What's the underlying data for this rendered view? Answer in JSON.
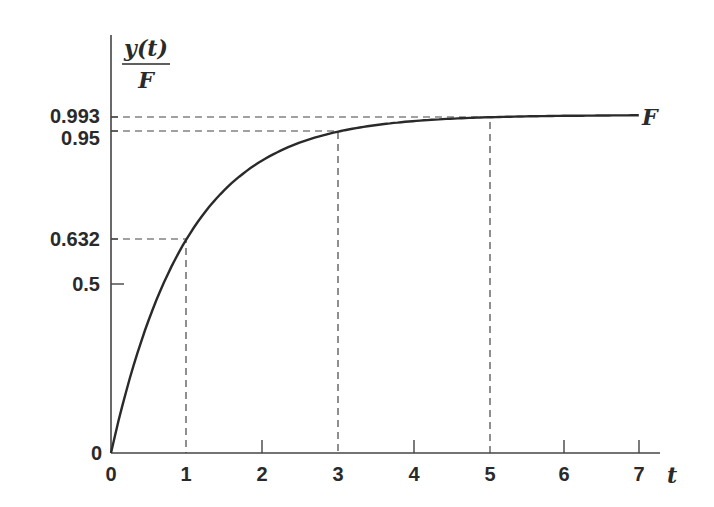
{
  "chart_data": {
    "type": "line",
    "title": "",
    "xlabel": "t",
    "ylabel": "y(t) / F",
    "ylabel_numerator": "y(t)",
    "ylabel_denominator": "F",
    "curve_label": "F",
    "function": "y(t)/F = 1 - exp(-t)",
    "xlim": [
      0,
      7
    ],
    "ylim": [
      0,
      1
    ],
    "grid": false,
    "x_ticks": [
      0,
      1,
      2,
      3,
      4,
      5,
      6,
      7
    ],
    "x_tick_labels": [
      "0",
      "1",
      "2",
      "3",
      "4",
      "5",
      "6",
      "7"
    ],
    "y_ticks": [
      0,
      0.5,
      0.632,
      0.95,
      0.993
    ],
    "y_tick_labels": [
      "0",
      "0.5",
      "0.632",
      "0.95",
      "0.993"
    ],
    "series": [
      {
        "name": "y(t)/F",
        "x": [
          0,
          0.5,
          1,
          1.5,
          2,
          2.5,
          3,
          3.5,
          4,
          4.5,
          5,
          5.5,
          6,
          6.5,
          7
        ],
        "values": [
          0,
          0.393,
          0.632,
          0.777,
          0.865,
          0.918,
          0.95,
          0.97,
          0.982,
          0.989,
          0.993,
          0.996,
          0.998,
          0.998,
          0.999
        ]
      }
    ],
    "annotations": [
      {
        "type": "dashed-guide",
        "x": 1,
        "y": 0.632
      },
      {
        "type": "dashed-guide",
        "x": 3,
        "y": 0.95
      },
      {
        "type": "dashed-guide",
        "x": 5,
        "y": 0.993
      }
    ]
  }
}
